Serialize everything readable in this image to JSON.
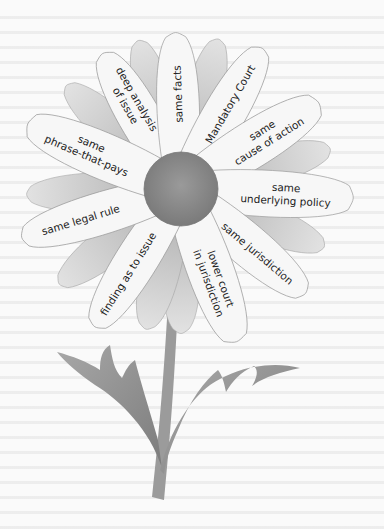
{
  "diagram": {
    "type": "flower",
    "center": {
      "label": ""
    },
    "petals": [
      {
        "id": "deep-analysis",
        "lines": [
          "deep analysis",
          "of issue"
        ],
        "angle": -120
      },
      {
        "id": "same-facts",
        "lines": [
          "same facts"
        ],
        "angle": -92
      },
      {
        "id": "mandatory-court",
        "lines": [
          "Mandatory Court"
        ],
        "angle": -60
      },
      {
        "id": "same-cause-of-action",
        "lines": [
          "same",
          "cause of action"
        ],
        "angle": -32
      },
      {
        "id": "same-underlying-policy",
        "lines": [
          "same",
          "underlying policy"
        ],
        "angle": 3
      },
      {
        "id": "same-jurisdiction",
        "lines": [
          "same jurisdiction"
        ],
        "angle": 40
      },
      {
        "id": "lower-court-in-jurisdiction",
        "lines": [
          "lower court",
          "in jurisdiction"
        ],
        "angle": 70
      },
      {
        "id": "finding-as-to-issue",
        "lines": [
          "finding as to issue"
        ],
        "angle": 122
      },
      {
        "id": "same-legal-rule",
        "lines": [
          "same legal rule"
        ],
        "angle": 163
      },
      {
        "id": "same-phrase-that-pays",
        "lines": [
          "same",
          "phrase-that-pays"
        ],
        "angle": -157
      }
    ],
    "colors": {
      "petal_labeled": "#f7f7f7",
      "petal_shaded": "#c9c9c9",
      "petal_outline": "#9a9a9a",
      "center": "#8a8a8a",
      "stem": "#9b9b9b",
      "leaf": "#8d8d8d"
    }
  }
}
